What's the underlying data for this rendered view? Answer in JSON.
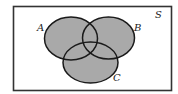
{
  "diagram": {
    "type": "venn",
    "universe": {
      "label": "S",
      "rect": {
        "x": 13.5,
        "y": 6.5,
        "width": 158,
        "height": 84
      },
      "label_pos": {
        "x": 155,
        "y": 18
      }
    },
    "sets": [
      {
        "label": "A",
        "cx": 71,
        "cy": 38.5,
        "rx": 26.5,
        "ry": 21.5,
        "label_pos": {
          "x": 37,
          "y": 31
        }
      },
      {
        "label": "B",
        "cx": 108.5,
        "cy": 38,
        "rx": 26,
        "ry": 21,
        "label_pos": {
          "x": 134,
          "y": 31
        }
      },
      {
        "label": "C",
        "cx": 90.5,
        "cy": 62.5,
        "rx": 27.5,
        "ry": 20.5,
        "label_pos": {
          "x": 113,
          "y": 81
        }
      }
    ],
    "shaded_region": "A ∪ B ∪ C",
    "colors": {
      "fill": "#a9a9a9",
      "stroke": "#1a1a1a",
      "border": "#333333",
      "background": "#ffffff"
    }
  }
}
